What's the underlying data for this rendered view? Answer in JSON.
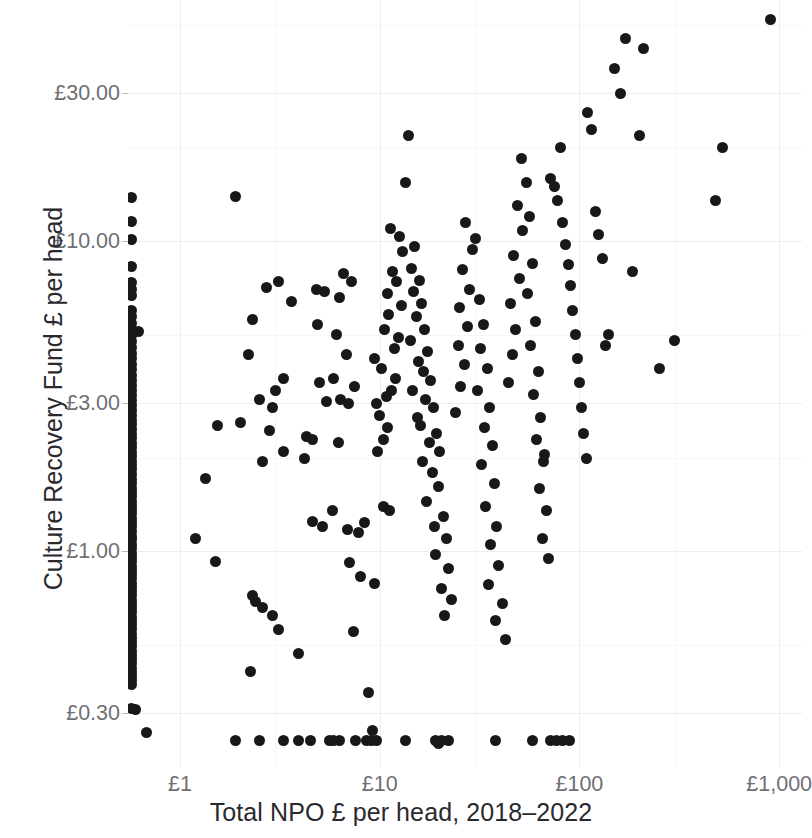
{
  "chart_data": {
    "type": "scatter",
    "title": "",
    "xlabel": "Total NPO £ per head, 2018–2022",
    "ylabel": "Culture Recovery Fund £ per head",
    "xscale": "log",
    "yscale": "log",
    "xlim": [
      0.55,
      1300
    ],
    "ylim": [
      0.2,
      60
    ],
    "grid": true,
    "legend": "none",
    "point_color": "#18181a",
    "grid_color": "#ededf0",
    "background": "#ffffff",
    "xticks": [
      {
        "label": "£1",
        "value": 1
      },
      {
        "label": "£10",
        "value": 10
      },
      {
        "label": "£100",
        "value": 100
      },
      {
        "label": "£1,000",
        "value": 1000
      }
    ],
    "yticks": [
      {
        "label": "£30.00",
        "value": 30
      },
      {
        "label": "£10.00",
        "value": 10
      },
      {
        "label": "£3.00",
        "value": 3
      },
      {
        "label": "£1.00",
        "value": 1
      },
      {
        "label": "£0.30",
        "value": 0.3
      }
    ],
    "n_points": 243,
    "points": [
      [
        0.62,
        5.1
      ],
      [
        1.9,
        14.0
      ],
      [
        2.3,
        5.6
      ],
      [
        2.7,
        7.1
      ],
      [
        3.1,
        7.4
      ],
      [
        3.6,
        6.4
      ],
      [
        2.2,
        4.3
      ],
      [
        2.5,
        3.1
      ],
      [
        2.9,
        2.9
      ],
      [
        3.0,
        3.3
      ],
      [
        3.3,
        3.6
      ],
      [
        2.8,
        2.45
      ],
      [
        3.3,
        2.1
      ],
      [
        2.6,
        1.95
      ],
      [
        2.0,
        2.6
      ],
      [
        1.55,
        2.55
      ],
      [
        1.35,
        1.72
      ],
      [
        1.5,
        0.93
      ],
      [
        1.2,
        1.1
      ],
      [
        2.3,
        0.72
      ],
      [
        2.4,
        0.69
      ],
      [
        2.6,
        0.66
      ],
      [
        2.9,
        0.62
      ],
      [
        3.1,
        0.56
      ],
      [
        2.25,
        0.41
      ],
      [
        3.9,
        0.47
      ],
      [
        4.6,
        1.25
      ],
      [
        5.2,
        1.2
      ],
      [
        4.3,
        2.35
      ],
      [
        4.6,
        2.3
      ],
      [
        4.2,
        2.0
      ],
      [
        5.4,
        3.05
      ],
      [
        5.0,
        3.5
      ],
      [
        4.9,
        5.4
      ],
      [
        5.3,
        6.9
      ],
      [
        4.8,
        7.0
      ],
      [
        6.3,
        6.6
      ],
      [
        6.6,
        7.9
      ],
      [
        7.2,
        7.4
      ],
      [
        6.1,
        5.0
      ],
      [
        6.8,
        4.3
      ],
      [
        5.9,
        3.6
      ],
      [
        6.4,
        3.1
      ],
      [
        7.0,
        3.0
      ],
      [
        7.5,
        3.4
      ],
      [
        6.2,
        2.25
      ],
      [
        5.8,
        1.35
      ],
      [
        6.9,
        1.18
      ],
      [
        7.8,
        1.15
      ],
      [
        8.4,
        1.24
      ],
      [
        7.1,
        0.92
      ],
      [
        8.0,
        0.83
      ],
      [
        9.4,
        0.79
      ],
      [
        7.4,
        0.55
      ],
      [
        8.8,
        0.35
      ],
      [
        9.2,
        0.265
      ],
      [
        10.5,
        1.4
      ],
      [
        11.2,
        1.35
      ],
      [
        9.8,
        2.1
      ],
      [
        10.4,
        2.3
      ],
      [
        11.0,
        2.5
      ],
      [
        10.0,
        2.75
      ],
      [
        9.6,
        3.0
      ],
      [
        10.8,
        3.15
      ],
      [
        11.4,
        3.3
      ],
      [
        12.0,
        3.6
      ],
      [
        10.2,
        3.9
      ],
      [
        9.4,
        4.2
      ],
      [
        11.8,
        4.5
      ],
      [
        12.4,
        4.9
      ],
      [
        10.6,
        5.2
      ],
      [
        11.1,
        5.8
      ],
      [
        12.8,
        6.2
      ],
      [
        10.9,
        6.8
      ],
      [
        12.2,
        7.4
      ],
      [
        11.6,
        8.0
      ],
      [
        13.0,
        9.3
      ],
      [
        12.6,
        10.4
      ],
      [
        11.3,
        11.0
      ],
      [
        14.0,
        22.0
      ],
      [
        13.4,
        15.5
      ],
      [
        15.0,
        9.6
      ],
      [
        14.4,
        8.2
      ],
      [
        15.8,
        7.5
      ],
      [
        14.8,
        6.9
      ],
      [
        16.2,
        6.3
      ],
      [
        15.2,
        5.7
      ],
      [
        16.8,
        5.2
      ],
      [
        14.2,
        4.8
      ],
      [
        17.4,
        4.4
      ],
      [
        15.6,
        4.1
      ],
      [
        16.5,
        3.8
      ],
      [
        18.0,
        3.55
      ],
      [
        14.6,
        3.3
      ],
      [
        17.0,
        3.1
      ],
      [
        18.6,
        2.9
      ],
      [
        15.4,
        2.7
      ],
      [
        16.0,
        2.55
      ],
      [
        19.2,
        2.4
      ],
      [
        17.8,
        2.25
      ],
      [
        20.0,
        2.1
      ],
      [
        16.4,
        1.95
      ],
      [
        18.4,
        1.8
      ],
      [
        19.6,
        1.62
      ],
      [
        17.2,
        1.45
      ],
      [
        20.8,
        1.3
      ],
      [
        18.8,
        1.2
      ],
      [
        21.5,
        1.1
      ],
      [
        19.0,
        0.98
      ],
      [
        22.0,
        0.88
      ],
      [
        20.4,
        0.76
      ],
      [
        23.0,
        0.7
      ],
      [
        21.0,
        0.62
      ],
      [
        19.8,
        0.24
      ],
      [
        24.0,
        2.8
      ],
      [
        25.5,
        3.4
      ],
      [
        26.5,
        4.0
      ],
      [
        24.8,
        4.6
      ],
      [
        27.5,
        5.3
      ],
      [
        25.0,
        6.1
      ],
      [
        28.0,
        7.0
      ],
      [
        26.0,
        8.1
      ],
      [
        29.0,
        9.4
      ],
      [
        27.0,
        11.5
      ],
      [
        30.0,
        10.2
      ],
      [
        31.5,
        6.5
      ],
      [
        33.0,
        5.4
      ],
      [
        32.0,
        4.5
      ],
      [
        34.5,
        3.9
      ],
      [
        31.0,
        3.3
      ],
      [
        35.5,
        2.9
      ],
      [
        33.5,
        2.5
      ],
      [
        36.5,
        2.2
      ],
      [
        32.5,
        1.9
      ],
      [
        37.5,
        1.65
      ],
      [
        34.0,
        1.4
      ],
      [
        38.5,
        1.2
      ],
      [
        36.0,
        1.05
      ],
      [
        39.5,
        0.9
      ],
      [
        35.0,
        0.78
      ],
      [
        41.0,
        0.68
      ],
      [
        38.0,
        0.6
      ],
      [
        42.5,
        0.52
      ],
      [
        44.0,
        3.5
      ],
      [
        46.0,
        4.3
      ],
      [
        48.0,
        5.2
      ],
      [
        45.0,
        6.3
      ],
      [
        50.0,
        7.6
      ],
      [
        47.0,
        9.0
      ],
      [
        52.0,
        10.8
      ],
      [
        49.0,
        13.0
      ],
      [
        54.0,
        15.5
      ],
      [
        51.0,
        18.5
      ],
      [
        56.0,
        12.0
      ],
      [
        58.0,
        8.5
      ],
      [
        55.0,
        6.8
      ],
      [
        60.0,
        5.5
      ],
      [
        57.0,
        4.6
      ],
      [
        62.0,
        3.8
      ],
      [
        59.0,
        3.2
      ],
      [
        64.0,
        2.7
      ],
      [
        61.0,
        2.3
      ],
      [
        66.0,
        1.95
      ],
      [
        63.0,
        1.6
      ],
      [
        68.0,
        1.35
      ],
      [
        65.0,
        1.1
      ],
      [
        70.0,
        0.95
      ],
      [
        67.0,
        2.05
      ],
      [
        72.0,
        16.0
      ],
      [
        75.0,
        15.0
      ],
      [
        78.0,
        13.5
      ],
      [
        80.0,
        20.0
      ],
      [
        82.0,
        11.5
      ],
      [
        85.0,
        9.8
      ],
      [
        88.0,
        8.4
      ],
      [
        90.0,
        7.2
      ],
      [
        92.0,
        6.0
      ],
      [
        95.0,
        5.0
      ],
      [
        98.0,
        4.2
      ],
      [
        100.0,
        3.5
      ],
      [
        102.0,
        2.9
      ],
      [
        105.0,
        2.4
      ],
      [
        108.0,
        2.0
      ],
      [
        110.0,
        26.0
      ],
      [
        115.0,
        23.0
      ],
      [
        120.0,
        12.5
      ],
      [
        125.0,
        10.5
      ],
      [
        130.0,
        8.8
      ],
      [
        135.0,
        4.6
      ],
      [
        140.0,
        5.0
      ],
      [
        150.0,
        36.0
      ],
      [
        160.0,
        30.0
      ],
      [
        170.0,
        45.0
      ],
      [
        185.0,
        8.0
      ],
      [
        200.0,
        22.0
      ],
      [
        210.0,
        42.0
      ],
      [
        250.0,
        3.9
      ],
      [
        300.0,
        4.8
      ],
      [
        480.0,
        13.5
      ],
      [
        520.0,
        20.0
      ],
      [
        900.0,
        52.0
      ],
      [
        0.6,
        0.31
      ],
      [
        0.68,
        0.26
      ],
      [
        1.9,
        0.245
      ],
      [
        2.5,
        0.245
      ],
      [
        3.3,
        0.245
      ],
      [
        3.9,
        0.245
      ],
      [
        4.5,
        0.245
      ],
      [
        5.6,
        0.245
      ],
      [
        5.9,
        0.245
      ],
      [
        6.3,
        0.245
      ],
      [
        7.6,
        0.245
      ],
      [
        8.6,
        0.245
      ],
      [
        9.1,
        0.245
      ],
      [
        9.6,
        0.245
      ],
      [
        13.5,
        0.245
      ],
      [
        19.0,
        0.245
      ],
      [
        20.5,
        0.245
      ],
      [
        22.0,
        0.245
      ],
      [
        38.0,
        0.245
      ],
      [
        58.0,
        0.245
      ],
      [
        72.0,
        0.245
      ],
      [
        77.0,
        0.245
      ],
      [
        82.0,
        0.245
      ],
      [
        89.0,
        0.245
      ]
    ],
    "edge_points": [
      [
        0.575,
        13.8
      ],
      [
        0.575,
        11.6
      ],
      [
        0.575,
        10.1
      ],
      [
        0.575,
        8.3
      ],
      [
        0.575,
        7.35
      ],
      [
        0.575,
        7.0
      ],
      [
        0.575,
        6.7
      ],
      [
        0.575,
        6.0
      ],
      [
        0.575,
        5.7
      ],
      [
        0.575,
        5.45
      ],
      [
        0.575,
        5.2
      ],
      [
        0.575,
        4.95
      ],
      [
        0.575,
        4.75
      ],
      [
        0.575,
        4.55
      ],
      [
        0.575,
        4.35
      ],
      [
        0.575,
        4.18
      ],
      [
        0.575,
        4.0
      ],
      [
        0.575,
        3.85
      ],
      [
        0.575,
        3.7
      ],
      [
        0.575,
        3.56
      ],
      [
        0.575,
        3.42
      ],
      [
        0.575,
        3.3
      ],
      [
        0.575,
        3.18
      ],
      [
        0.575,
        3.06
      ],
      [
        0.575,
        2.95
      ],
      [
        0.575,
        2.85
      ],
      [
        0.575,
        2.75
      ],
      [
        0.575,
        2.65
      ],
      [
        0.575,
        2.56
      ],
      [
        0.575,
        2.47
      ],
      [
        0.575,
        2.39
      ],
      [
        0.575,
        2.31
      ],
      [
        0.575,
        2.23
      ],
      [
        0.575,
        2.16
      ],
      [
        0.575,
        2.09
      ],
      [
        0.575,
        2.02
      ],
      [
        0.575,
        1.95
      ],
      [
        0.575,
        1.89
      ],
      [
        0.575,
        1.83
      ],
      [
        0.575,
        1.77
      ],
      [
        0.575,
        1.71
      ],
      [
        0.575,
        1.66
      ],
      [
        0.575,
        1.6
      ],
      [
        0.575,
        1.55
      ],
      [
        0.575,
        1.5
      ],
      [
        0.575,
        1.45
      ],
      [
        0.575,
        1.41
      ],
      [
        0.575,
        1.36
      ],
      [
        0.575,
        1.32
      ],
      [
        0.575,
        1.28
      ],
      [
        0.575,
        1.24
      ],
      [
        0.575,
        1.2
      ],
      [
        0.575,
        1.16
      ],
      [
        0.575,
        1.12
      ],
      [
        0.575,
        1.09
      ],
      [
        0.575,
        1.05
      ],
      [
        0.575,
        1.02
      ],
      [
        0.575,
        0.985
      ],
      [
        0.575,
        0.955
      ],
      [
        0.575,
        0.925
      ],
      [
        0.575,
        0.895
      ],
      [
        0.575,
        0.868
      ],
      [
        0.575,
        0.84
      ],
      [
        0.575,
        0.815
      ],
      [
        0.575,
        0.79
      ],
      [
        0.575,
        0.765
      ],
      [
        0.575,
        0.74
      ],
      [
        0.575,
        0.718
      ],
      [
        0.575,
        0.695
      ],
      [
        0.575,
        0.674
      ],
      [
        0.575,
        0.653
      ],
      [
        0.575,
        0.633
      ],
      [
        0.575,
        0.613
      ],
      [
        0.575,
        0.594
      ],
      [
        0.575,
        0.576
      ],
      [
        0.575,
        0.558
      ],
      [
        0.575,
        0.541
      ],
      [
        0.575,
        0.524
      ],
      [
        0.575,
        0.508
      ],
      [
        0.575,
        0.492
      ],
      [
        0.575,
        0.477
      ],
      [
        0.575,
        0.462
      ],
      [
        0.575,
        0.448
      ],
      [
        0.575,
        0.434
      ],
      [
        0.575,
        0.42
      ],
      [
        0.575,
        0.407
      ],
      [
        0.575,
        0.395
      ],
      [
        0.575,
        0.383
      ],
      [
        0.575,
        0.372
      ],
      [
        0.575,
        0.311
      ]
    ]
  }
}
